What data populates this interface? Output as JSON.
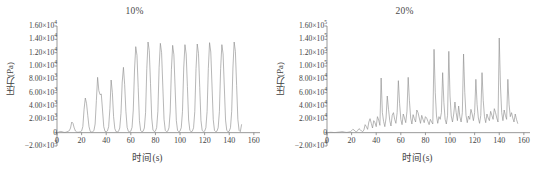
{
  "figure": {
    "panels": [
      {
        "id": "panel-10",
        "title": "10%",
        "ylabel": "压力(Pa)",
        "xlabel": "时间(s)"
      },
      {
        "id": "panel-20",
        "title": "20%",
        "ylabel": "压力(Pa)",
        "xlabel": "时间(s)"
      }
    ],
    "line_color": "#8f8f8f",
    "axis_color": "#6e6e6e",
    "text_color": "#3f3f3f",
    "background": "#ffffff"
  },
  "chart_data": [
    {
      "type": "line",
      "title": "10%",
      "xlabel": "时间(s)",
      "ylabel": "压力(Pa)",
      "xlim": [
        0,
        165
      ],
      "ylim": [
        -2000,
        16000
      ],
      "xticks": [
        0,
        20,
        40,
        60,
        80,
        100,
        120,
        140,
        160
      ],
      "xtick_labels": [
        "0",
        "20",
        "40",
        "60",
        "80",
        "100",
        "120",
        "140",
        "160"
      ],
      "yticks": [
        -2000,
        0,
        2000,
        4000,
        6000,
        8000,
        10000,
        12000,
        14000,
        16000
      ],
      "ytick_labels": [
        {
          "mantissa": "−2.00×10",
          "exp": "3"
        },
        {
          "mantissa": "0",
          "exp": ""
        },
        {
          "mantissa": "2.00×10",
          "exp": "3"
        },
        {
          "mantissa": "4.00×10",
          "exp": "3"
        },
        {
          "mantissa": "6.00×10",
          "exp": "3"
        },
        {
          "mantissa": "8.00×10",
          "exp": "3"
        },
        {
          "mantissa": "1.00×10",
          "exp": "4"
        },
        {
          "mantissa": "1.20×10",
          "exp": "4"
        },
        {
          "mantissa": "1.40×10",
          "exp": "4"
        },
        {
          "mantissa": "1.60×10",
          "exp": "4"
        }
      ],
      "grid": false,
      "legend": "none",
      "series": [
        {
          "name": "pressure-10pct",
          "x": [
            0,
            1,
            2,
            3,
            4,
            5,
            6,
            7,
            8,
            9,
            10,
            11,
            12,
            13,
            14,
            15,
            16,
            17,
            18,
            19,
            20,
            21,
            22,
            23,
            24,
            25,
            26,
            27,
            28,
            29,
            30,
            31,
            32,
            33,
            34,
            35,
            36,
            37,
            38,
            39,
            40,
            41,
            42,
            43,
            44,
            45,
            46,
            47,
            48,
            49,
            50,
            51,
            52,
            53,
            54,
            55,
            56,
            57,
            58,
            59,
            60,
            61,
            62,
            63,
            64,
            65,
            66,
            67,
            68,
            69,
            70,
            71,
            72,
            73,
            74,
            75,
            76,
            77,
            78,
            79,
            80,
            81,
            82,
            83,
            84,
            85,
            86,
            87,
            88,
            89,
            90,
            91,
            92,
            93,
            94,
            95,
            96,
            97,
            98,
            99,
            100,
            101,
            102,
            103,
            104,
            105,
            106,
            107,
            108,
            109,
            110,
            111,
            112,
            113,
            114,
            115,
            116,
            117,
            118,
            119,
            120,
            121,
            122,
            123,
            124,
            125,
            126,
            127,
            128,
            129,
            130,
            131,
            132,
            133,
            134,
            135,
            136,
            137,
            138,
            139,
            140,
            141,
            142,
            143,
            144,
            145,
            146,
            147,
            148,
            149,
            150,
            151,
            152,
            153,
            154,
            155,
            156
          ],
          "y": [
            0,
            60,
            140,
            180,
            150,
            80,
            40,
            60,
            120,
            200,
            300,
            700,
            1600,
            1400,
            700,
            250,
            100,
            60,
            80,
            140,
            260,
            900,
            3500,
            5200,
            4400,
            2600,
            900,
            200,
            100,
            140,
            300,
            1300,
            4800,
            8300,
            6300,
            5700,
            5800,
            3400,
            900,
            200,
            150,
            260,
            900,
            3600,
            7900,
            6000,
            2400,
            600,
            150,
            120,
            200,
            700,
            2900,
            7600,
            9800,
            7200,
            3200,
            800,
            200,
            150,
            230,
            800,
            3400,
            9400,
            12900,
            11600,
            6800,
            1800,
            300,
            150,
            220,
            700,
            3000,
            9600,
            13600,
            12300,
            7400,
            2200,
            400,
            160,
            230,
            750,
            3200,
            9800,
            13400,
            12000,
            7000,
            2000,
            350,
            150,
            220,
            720,
            3100,
            9500,
            13100,
            11700,
            6700,
            1800,
            320,
            150,
            230,
            740,
            3200,
            9700,
            13200,
            11800,
            6900,
            1900,
            330,
            150,
            220,
            730,
            3150,
            9600,
            13300,
            11900,
            6800,
            1850,
            330,
            150,
            225,
            735,
            3180,
            9650,
            13500,
            12100,
            7000,
            1950,
            340,
            150,
            220,
            730,
            3160,
            9600,
            13200,
            11800,
            6850,
            1880,
            330,
            150,
            225,
            740,
            3200,
            9700,
            13600,
            12200,
            7100,
            2000,
            350,
            150,
            1200
          ]
        }
      ]
    },
    {
      "type": "line",
      "title": "20%",
      "xlabel": "时间(s)",
      "ylabel": "压力(Pa)",
      "xlim": [
        0,
        165
      ],
      "ylim": [
        -20000,
        160000
      ],
      "xticks": [
        0,
        20,
        40,
        60,
        80,
        100,
        120,
        140,
        160
      ],
      "xtick_labels": [
        "0",
        "20",
        "40",
        "60",
        "80",
        "100",
        "120",
        "140",
        "160"
      ],
      "yticks": [
        -20000,
        0,
        20000,
        40000,
        60000,
        80000,
        100000,
        120000,
        140000,
        160000
      ],
      "ytick_labels": [
        {
          "mantissa": "−2.00×10",
          "exp": "4"
        },
        {
          "mantissa": "0",
          "exp": ""
        },
        {
          "mantissa": "2.00×10",
          "exp": "4"
        },
        {
          "mantissa": "4.00×10",
          "exp": "4"
        },
        {
          "mantissa": "6.00×10",
          "exp": "4"
        },
        {
          "mantissa": "8.00×10",
          "exp": "4"
        },
        {
          "mantissa": "1.00×10",
          "exp": "5"
        },
        {
          "mantissa": "1.20×10",
          "exp": "5"
        },
        {
          "mantissa": "1.40×10",
          "exp": "5"
        },
        {
          "mantissa": "1.60×10",
          "exp": "5"
        }
      ],
      "grid": false,
      "legend": "none",
      "series": [
        {
          "name": "pressure-20pct",
          "x": [
            0,
            1,
            2,
            3,
            4,
            5,
            6,
            7,
            8,
            9,
            10,
            11,
            12,
            13,
            14,
            15,
            16,
            17,
            18,
            19,
            20,
            21,
            22,
            23,
            24,
            25,
            26,
            27,
            28,
            29,
            30,
            31,
            32,
            33,
            34,
            35,
            36,
            37,
            38,
            39,
            40,
            41,
            42,
            43,
            44,
            45,
            46,
            47,
            48,
            49,
            50,
            51,
            52,
            53,
            54,
            55,
            56,
            57,
            58,
            59,
            60,
            61,
            62,
            63,
            64,
            65,
            66,
            67,
            68,
            69,
            70,
            71,
            72,
            73,
            74,
            75,
            76,
            77,
            78,
            79,
            80,
            81,
            82,
            83,
            84,
            85,
            86,
            87,
            88,
            89,
            90,
            91,
            92,
            93,
            94,
            95,
            96,
            97,
            98,
            99,
            100,
            101,
            102,
            103,
            104,
            105,
            106,
            107,
            108,
            109,
            110,
            111,
            112,
            113,
            114,
            115,
            116,
            117,
            118,
            119,
            120,
            121,
            122,
            123,
            124,
            125,
            126,
            127,
            128,
            129,
            130,
            131,
            132,
            133,
            134,
            135,
            136,
            137,
            138,
            139,
            140,
            141,
            142,
            143,
            144,
            145,
            146,
            147,
            148,
            149,
            150,
            151,
            152,
            153,
            154,
            155,
            156,
            157,
            158,
            159,
            160
          ],
          "y": [
            0,
            200,
            400,
            600,
            500,
            300,
            200,
            300,
            500,
            700,
            900,
            1200,
            1500,
            1300,
            900,
            600,
            400,
            600,
            1000,
            1500,
            3000,
            5000,
            4000,
            2000,
            1200,
            3500,
            6000,
            4500,
            2500,
            1500,
            4000,
            12000,
            9000,
            5000,
            16000,
            21000,
            14000,
            7000,
            18000,
            15000,
            9000,
            24000,
            19000,
            11000,
            82000,
            30000,
            17000,
            9000,
            22000,
            55000,
            35000,
            18000,
            10000,
            26000,
            30000,
            20000,
            14000,
            30000,
            78000,
            44000,
            20000,
            12000,
            28000,
            22000,
            15000,
            32000,
            83000,
            48000,
            22000,
            13000,
            27000,
            21000,
            16000,
            34000,
            30000,
            22000,
            14000,
            26000,
            20000,
            15000,
            24000,
            22000,
            17000,
            12000,
            20000,
            16000,
            13000,
            125000,
            60000,
            25000,
            14000,
            24000,
            20000,
            30000,
            90000,
            45000,
            20000,
            13000,
            26000,
            122000,
            55000,
            25000,
            16000,
            28000,
            46000,
            30000,
            18000,
            40000,
            24000,
            16000,
            30000,
            118000,
            60000,
            26000,
            15000,
            25000,
            20000,
            35000,
            28000,
            18000,
            30000,
            80000,
            42000,
            22000,
            14000,
            26000,
            90000,
            48000,
            24000,
            15000,
            28000,
            22000,
            18000,
            32000,
            26000,
            20000,
            36000,
            30000,
            22000,
            16000,
            142000,
            70000,
            30000,
            18000,
            34000,
            26000,
            20000,
            80000,
            42000,
            24000,
            30000,
            22000,
            16000,
            28000,
            20000,
            14000
          ]
        }
      ]
    }
  ]
}
